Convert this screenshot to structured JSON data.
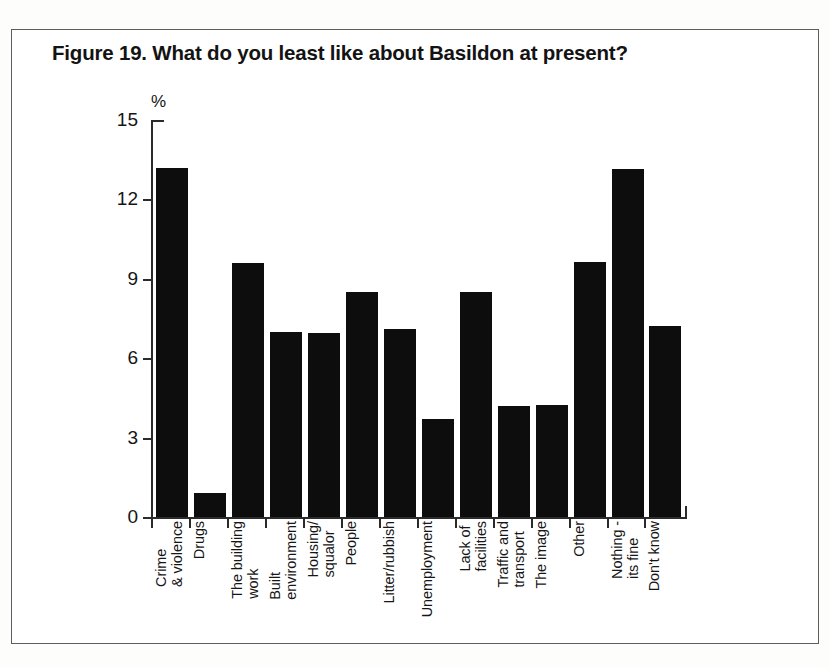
{
  "figure": {
    "title": "Figure 19. What do you least like about Basildon at present?",
    "unit_label": "%"
  },
  "chart_data": {
    "type": "bar",
    "title": "Figure 19. What do you least like about Basildon at present?",
    "xlabel": "",
    "ylabel": "%",
    "ylim": [
      0,
      15
    ],
    "yticks": [
      0,
      3,
      6,
      9,
      12,
      15
    ],
    "grid": false,
    "legend": null,
    "bar_color": "#0d0d0d",
    "categories": [
      "Crime\n& violence",
      "Drugs",
      "The building\nwork",
      "Built\nenvironment",
      "Housing/\nsqualor",
      "People",
      "Litter/rubbish",
      "Unemployment",
      "Lack of\nfacilities",
      "Traffic and\ntransport",
      "The image",
      "Other",
      "Nothing -\nits fine",
      "Don't know"
    ],
    "values": [
      13.2,
      0.9,
      9.6,
      7.0,
      6.95,
      8.5,
      7.1,
      3.7,
      8.5,
      4.2,
      4.25,
      9.65,
      13.15,
      7.2
    ]
  }
}
